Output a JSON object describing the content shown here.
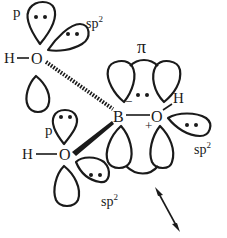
{
  "diagram": {
    "type": "molecular-orbital-schematic",
    "atoms": {
      "top_oxygen": {
        "symbol": "O",
        "hydrogen": "H",
        "orbital_labels": [
          "p",
          "sp2"
        ]
      },
      "bottom_oxygen": {
        "symbol": "O",
        "hydrogen": "H",
        "orbital_labels": [
          "p",
          "sp2"
        ]
      },
      "boron": {
        "symbol": "B",
        "charge": "−"
      },
      "right_oxygen": {
        "symbol": "O",
        "hydrogen": "H",
        "charge": "+",
        "orbital_labels": [
          "sp2"
        ]
      }
    },
    "labels": {
      "pi": "π",
      "p_top": "p",
      "sp2_top": "sp",
      "sp2_top_sup": "2",
      "p_bottom": "p",
      "sp2_bottom": "sp",
      "sp2_bottom_sup": "2",
      "sp2_right": "sp",
      "sp2_right_sup": "2",
      "H_top": "H",
      "O_top": "O",
      "H_bottom": "H",
      "O_bottom": "O",
      "B": "B",
      "O_right": "O",
      "H_right": "H",
      "minus": "−",
      "plus": "+"
    },
    "bonds": [
      {
        "from": "top_oxygen",
        "to": "boron",
        "style": "hashed"
      },
      {
        "from": "bottom_oxygen",
        "to": "boron",
        "style": "wedge"
      },
      {
        "from": "boron",
        "to": "right_oxygen",
        "style": "single"
      }
    ],
    "arrow": {
      "type": "double-headed",
      "meaning": "rotation/vibration axis"
    }
  }
}
